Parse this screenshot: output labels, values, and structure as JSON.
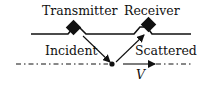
{
  "diagram": {
    "type": "radar-scattering-geometry",
    "labels": {
      "transmitter": "Transmitter",
      "receiver": "Receiver",
      "incident": "Incident",
      "scattered": "Scattered",
      "velocity": "V"
    },
    "colors": {
      "stroke": "#111111",
      "background": "#ffffff"
    }
  }
}
